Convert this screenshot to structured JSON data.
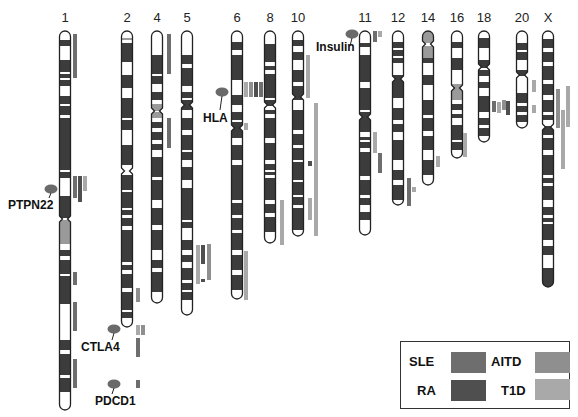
{
  "figure": {
    "type": "ideogram"
  },
  "colors": {
    "SLE": "#6e6e6e",
    "RA": "#4f4f4f",
    "AITD": "#8f8f8f",
    "T1D": "#a9a9a9",
    "band_dark": "#3c3c3c",
    "band_light": "#ffffff",
    "band_gray": "#9a9a9a",
    "gene_marker": "#6a6a6a"
  },
  "chromosomes": [
    {
      "id": "1",
      "label": "1",
      "x": 65,
      "top": 31,
      "bottom": 410,
      "centromere": 219,
      "bands": [
        [
          40,
          46,
          "d"
        ],
        [
          60,
          72,
          "d"
        ],
        [
          74,
          78,
          "d"
        ],
        [
          80,
          86,
          "d"
        ],
        [
          96,
          104,
          "d"
        ],
        [
          106,
          115,
          "d"
        ],
        [
          118,
          170,
          "d"
        ],
        [
          172,
          178,
          "d"
        ],
        [
          196,
          218,
          "d"
        ],
        [
          220,
          244,
          "g"
        ],
        [
          250,
          256,
          "d"
        ],
        [
          260,
          274,
          "d"
        ],
        [
          276,
          304,
          "d"
        ],
        [
          340,
          350,
          "d"
        ],
        [
          354,
          375,
          "d"
        ],
        [
          378,
          392,
          "d"
        ]
      ]
    },
    {
      "id": "2",
      "label": "2",
      "x": 127,
      "top": 31,
      "bottom": 327,
      "centromere": 171,
      "bands": [
        [
          38,
          40,
          "g"
        ],
        [
          43,
          62,
          "d"
        ],
        [
          75,
          88,
          "d"
        ],
        [
          98,
          118,
          "d"
        ],
        [
          120,
          130,
          "d"
        ],
        [
          145,
          165,
          "d"
        ],
        [
          175,
          190,
          "d"
        ],
        [
          192,
          208,
          "d"
        ],
        [
          210,
          215,
          "d"
        ],
        [
          218,
          226,
          "d"
        ],
        [
          230,
          262,
          "d"
        ],
        [
          265,
          270,
          "d"
        ],
        [
          274,
          288,
          "d"
        ],
        [
          292,
          310,
          "d"
        ],
        [
          312,
          318,
          "d"
        ]
      ]
    },
    {
      "id": "4",
      "label": "4",
      "x": 157,
      "top": 31,
      "bottom": 303,
      "centromere": 111,
      "bands": [
        [
          55,
          74,
          "d"
        ],
        [
          76,
          84,
          "d"
        ],
        [
          92,
          100,
          "d"
        ],
        [
          104,
          111,
          "g"
        ],
        [
          112,
          118,
          "g"
        ],
        [
          122,
          128,
          "d"
        ],
        [
          132,
          140,
          "d"
        ],
        [
          144,
          150,
          "d"
        ],
        [
          157,
          177,
          "d"
        ],
        [
          180,
          200,
          "d"
        ],
        [
          208,
          225,
          "d"
        ],
        [
          230,
          250,
          "d"
        ],
        [
          260,
          268,
          "d"
        ],
        [
          272,
          292,
          "d"
        ]
      ]
    },
    {
      "id": "5",
      "label": "5",
      "x": 187,
      "top": 31,
      "bottom": 315,
      "centromere": 105,
      "bands": [
        [
          55,
          64,
          "d"
        ],
        [
          68,
          86,
          "d"
        ],
        [
          92,
          98,
          "d"
        ],
        [
          100,
          110,
          "d"
        ],
        [
          118,
          130,
          "d"
        ],
        [
          135,
          150,
          "d"
        ],
        [
          152,
          160,
          "d"
        ],
        [
          167,
          180,
          "d"
        ],
        [
          188,
          220,
          "d"
        ],
        [
          222,
          228,
          "d"
        ],
        [
          240,
          250,
          "d"
        ],
        [
          255,
          262,
          "d"
        ],
        [
          268,
          280,
          "d"
        ],
        [
          283,
          290,
          "d"
        ],
        [
          292,
          300,
          "d"
        ]
      ]
    },
    {
      "id": "6",
      "label": "6",
      "x": 237,
      "top": 31,
      "bottom": 299,
      "centromere": 128,
      "bands": [
        [
          42,
          50,
          "d"
        ],
        [
          55,
          80,
          "d"
        ],
        [
          95,
          105,
          "d"
        ],
        [
          112,
          120,
          "d"
        ],
        [
          122,
          138,
          "d"
        ],
        [
          145,
          160,
          "d"
        ],
        [
          165,
          200,
          "d"
        ],
        [
          203,
          215,
          "d"
        ],
        [
          218,
          230,
          "d"
        ],
        [
          233,
          250,
          "d"
        ],
        [
          255,
          270,
          "d"
        ],
        [
          275,
          290,
          "d"
        ]
      ]
    },
    {
      "id": "8",
      "label": "8",
      "x": 270,
      "top": 31,
      "bottom": 243,
      "centromere": 105,
      "bands": [
        [
          44,
          62,
          "d"
        ],
        [
          66,
          70,
          "d"
        ],
        [
          74,
          98,
          "d"
        ],
        [
          100,
          106,
          "d"
        ],
        [
          110,
          114,
          "d"
        ],
        [
          118,
          138,
          "d"
        ],
        [
          143,
          160,
          "d"
        ],
        [
          164,
          170,
          "d"
        ],
        [
          172,
          175,
          "d"
        ],
        [
          178,
          200,
          "d"
        ],
        [
          204,
          213,
          "d"
        ],
        [
          217,
          232,
          "d"
        ]
      ]
    },
    {
      "id": "10",
      "label": "10",
      "x": 298,
      "top": 31,
      "bottom": 236,
      "centromere": 97,
      "bands": [
        [
          40,
          46,
          "d"
        ],
        [
          52,
          60,
          "d"
        ],
        [
          70,
          82,
          "d"
        ],
        [
          86,
          100,
          "d"
        ],
        [
          110,
          130,
          "d"
        ],
        [
          134,
          145,
          "d"
        ],
        [
          148,
          160,
          "d"
        ],
        [
          162,
          180,
          "d"
        ],
        [
          182,
          195,
          "d"
        ],
        [
          197,
          205,
          "d"
        ],
        [
          208,
          230,
          "d"
        ]
      ]
    },
    {
      "id": "11",
      "label": "11",
      "x": 365,
      "top": 31,
      "bottom": 235,
      "centromere": 117,
      "bands": [
        [
          43,
          47,
          "d"
        ],
        [
          55,
          82,
          "d"
        ],
        [
          88,
          110,
          "d"
        ],
        [
          112,
          132,
          "d"
        ],
        [
          137,
          140,
          "d"
        ],
        [
          142,
          148,
          "d"
        ],
        [
          152,
          176,
          "d"
        ],
        [
          180,
          195,
          "d"
        ],
        [
          198,
          205,
          "d"
        ],
        [
          212,
          220,
          "d"
        ]
      ]
    },
    {
      "id": "12",
      "label": "12",
      "x": 398,
      "top": 31,
      "bottom": 205,
      "centromere": 79,
      "bands": [
        [
          42,
          48,
          "d"
        ],
        [
          50,
          56,
          "d"
        ],
        [
          58,
          63,
          "d"
        ],
        [
          75,
          98,
          "d"
        ],
        [
          108,
          120,
          "d"
        ],
        [
          124,
          132,
          "d"
        ],
        [
          140,
          160,
          "d"
        ],
        [
          170,
          180,
          "d"
        ],
        [
          185,
          200,
          "d"
        ]
      ]
    },
    {
      "id": "14",
      "label": "14",
      "x": 428,
      "top": 31,
      "bottom": 185,
      "centromere": 44,
      "bands": [
        [
          31,
          43,
          "g"
        ],
        [
          46,
          58,
          "g"
        ],
        [
          58,
          63,
          "d"
        ],
        [
          75,
          85,
          "d"
        ],
        [
          100,
          115,
          "d"
        ],
        [
          118,
          131,
          "d"
        ],
        [
          136,
          150,
          "d"
        ],
        [
          160,
          175,
          "d"
        ]
      ]
    },
    {
      "id": "16",
      "label": "16",
      "x": 457,
      "top": 31,
      "bottom": 158,
      "centromere": 88,
      "bands": [
        [
          42,
          48,
          "d"
        ],
        [
          58,
          70,
          "d"
        ],
        [
          84,
          92,
          "g"
        ],
        [
          92,
          100,
          "g"
        ],
        [
          104,
          110,
          "d"
        ],
        [
          114,
          118,
          "d"
        ],
        [
          125,
          140,
          "d"
        ],
        [
          142,
          150,
          "d"
        ]
      ]
    },
    {
      "id": "18",
      "label": "18",
      "x": 484,
      "top": 31,
      "bottom": 142,
      "centromere": 67,
      "bands": [
        [
          38,
          48,
          "d"
        ],
        [
          60,
          68,
          "d"
        ],
        [
          70,
          76,
          "d"
        ],
        [
          82,
          88,
          "d"
        ],
        [
          96,
          112,
          "d"
        ],
        [
          118,
          125,
          "d"
        ],
        [
          128,
          136,
          "d"
        ]
      ]
    },
    {
      "id": "20",
      "label": "20",
      "x": 522,
      "top": 31,
      "bottom": 128,
      "centromere": 75,
      "bands": [
        [
          43,
          50,
          "d"
        ],
        [
          52,
          60,
          "d"
        ],
        [
          70,
          76,
          "d"
        ],
        [
          93,
          103,
          "d"
        ],
        [
          106,
          112,
          "d"
        ],
        [
          115,
          122,
          "d"
        ]
      ]
    },
    {
      "id": "X",
      "label": "X",
      "x": 548,
      "top": 31,
      "bottom": 287,
      "centromere": 127,
      "bands": [
        [
          39,
          48,
          "d"
        ],
        [
          52,
          62,
          "d"
        ],
        [
          66,
          80,
          "d"
        ],
        [
          84,
          95,
          "d"
        ],
        [
          100,
          112,
          "d"
        ],
        [
          115,
          120,
          "d"
        ],
        [
          126,
          135,
          "d"
        ],
        [
          138,
          150,
          "d"
        ],
        [
          155,
          175,
          "d"
        ],
        [
          178,
          183,
          "d"
        ],
        [
          186,
          200,
          "d"
        ],
        [
          207,
          215,
          "d"
        ],
        [
          218,
          222,
          "d"
        ],
        [
          224,
          240,
          "d"
        ],
        [
          246,
          255,
          "d"
        ],
        [
          268,
          287,
          "d"
        ]
      ]
    }
  ],
  "linkage_bars": [
    {
      "chr": "1",
      "x": 73,
      "y1": 34,
      "y2": 78,
      "w": 4,
      "disease": "SLE"
    },
    {
      "chr": "1",
      "x": 73,
      "y1": 176,
      "y2": 198,
      "w": 4,
      "disease": "SLE"
    },
    {
      "chr": "1",
      "x": 78,
      "y1": 176,
      "y2": 202,
      "w": 4,
      "disease": "RA"
    },
    {
      "chr": "1",
      "x": 83,
      "y1": 176,
      "y2": 191,
      "w": 4,
      "disease": "T1D"
    },
    {
      "chr": "1",
      "x": 73,
      "y1": 272,
      "y2": 285,
      "w": 4,
      "disease": "SLE"
    },
    {
      "chr": "1",
      "x": 73,
      "y1": 302,
      "y2": 331,
      "w": 4,
      "disease": "SLE"
    },
    {
      "chr": "1",
      "x": 73,
      "y1": 359,
      "y2": 388,
      "w": 4,
      "disease": "SLE"
    },
    {
      "chr": "2",
      "x": 136,
      "y1": 288,
      "y2": 302,
      "w": 4,
      "disease": "AITD"
    },
    {
      "chr": "2",
      "x": 136,
      "y1": 325,
      "y2": 335,
      "w": 4,
      "disease": "T1D"
    },
    {
      "chr": "2",
      "x": 141,
      "y1": 325,
      "y2": 335,
      "w": 4,
      "disease": "AITD"
    },
    {
      "chr": "2",
      "x": 136,
      "y1": 338,
      "y2": 357,
      "w": 4,
      "disease": "SLE"
    },
    {
      "chr": "2",
      "x": 136,
      "y1": 380,
      "y2": 388,
      "w": 4,
      "disease": "SLE"
    },
    {
      "chr": "4",
      "x": 167,
      "y1": 34,
      "y2": 74,
      "w": 4,
      "disease": "SLE"
    },
    {
      "chr": "4",
      "x": 167,
      "y1": 118,
      "y2": 148,
      "w": 4,
      "disease": "SLE"
    },
    {
      "chr": "5",
      "x": 196,
      "y1": 245,
      "y2": 284,
      "w": 4,
      "disease": "T1D"
    },
    {
      "chr": "5",
      "x": 201,
      "y1": 245,
      "y2": 264,
      "w": 4,
      "disease": "RA"
    },
    {
      "chr": "5",
      "x": 201,
      "y1": 279,
      "y2": 282,
      "w": 4,
      "disease": "RA"
    },
    {
      "chr": "5",
      "x": 207,
      "y1": 244,
      "y2": 280,
      "w": 4,
      "disease": "AITD"
    },
    {
      "chr": "6",
      "x": 244,
      "y1": 82,
      "y2": 97,
      "w": 4,
      "disease": "T1D"
    },
    {
      "chr": "6",
      "x": 249,
      "y1": 82,
      "y2": 97,
      "w": 4,
      "disease": "AITD"
    },
    {
      "chr": "6",
      "x": 254,
      "y1": 82,
      "y2": 97,
      "w": 4,
      "disease": "RA"
    },
    {
      "chr": "6",
      "x": 259,
      "y1": 82,
      "y2": 97,
      "w": 4,
      "disease": "SLE"
    },
    {
      "chr": "6",
      "x": 244,
      "y1": 123,
      "y2": 130,
      "w": 4,
      "disease": "T1D"
    },
    {
      "chr": "6",
      "x": 244,
      "y1": 251,
      "y2": 300,
      "w": 4,
      "disease": "T1D"
    },
    {
      "chr": "8",
      "x": 280,
      "y1": 200,
      "y2": 245,
      "w": 4,
      "disease": "T1D"
    },
    {
      "chr": "10",
      "x": 306,
      "y1": 55,
      "y2": 98,
      "w": 4,
      "disease": "T1D"
    },
    {
      "chr": "10",
      "x": 314,
      "y1": 103,
      "y2": 236,
      "w": 4,
      "disease": "T1D"
    },
    {
      "chr": "10",
      "x": 308,
      "y1": 161,
      "y2": 166,
      "w": 4,
      "disease": "RA"
    },
    {
      "chr": "10",
      "x": 308,
      "y1": 198,
      "y2": 220,
      "w": 4,
      "disease": "T1D"
    },
    {
      "chr": "11",
      "x": 373,
      "y1": 31,
      "y2": 42,
      "w": 4,
      "disease": "SLE"
    },
    {
      "chr": "11",
      "x": 378,
      "y1": 31,
      "y2": 37,
      "w": 4,
      "disease": "T1D"
    },
    {
      "chr": "11",
      "x": 373,
      "y1": 132,
      "y2": 153,
      "w": 4,
      "disease": "T1D"
    },
    {
      "chr": "11",
      "x": 378,
      "y1": 153,
      "y2": 173,
      "w": 4,
      "disease": "SLE"
    },
    {
      "chr": "12",
      "x": 407,
      "y1": 178,
      "y2": 206,
      "w": 4,
      "disease": "SLE"
    },
    {
      "chr": "12",
      "x": 412,
      "y1": 187,
      "y2": 192,
      "w": 4,
      "disease": "T1D"
    },
    {
      "chr": "14",
      "x": 436,
      "y1": 156,
      "y2": 167,
      "w": 4,
      "disease": "T1D"
    },
    {
      "chr": "16",
      "x": 463,
      "y1": 133,
      "y2": 157,
      "w": 4,
      "disease": "T1D"
    },
    {
      "chr": "18",
      "x": 492,
      "y1": 101,
      "y2": 112,
      "w": 4,
      "disease": "SLE"
    },
    {
      "chr": "18",
      "x": 497,
      "y1": 102,
      "y2": 113,
      "w": 4,
      "disease": "T1D"
    },
    {
      "chr": "18",
      "x": 502,
      "y1": 100,
      "y2": 110,
      "w": 4,
      "disease": "AITD"
    },
    {
      "chr": "18",
      "x": 506,
      "y1": 101,
      "y2": 115,
      "w": 4,
      "disease": "RA"
    },
    {
      "chr": "20",
      "x": 532,
      "y1": 80,
      "y2": 92,
      "w": 4,
      "disease": "T1D"
    },
    {
      "chr": "20",
      "x": 532,
      "y1": 105,
      "y2": 113,
      "w": 4,
      "disease": "T1D"
    },
    {
      "chr": "X",
      "x": 556,
      "y1": 89,
      "y2": 128,
      "w": 4,
      "disease": "AITD"
    },
    {
      "chr": "X",
      "x": 561,
      "y1": 110,
      "y2": 169,
      "w": 4,
      "disease": "T1D"
    },
    {
      "chr": "X",
      "x": 566,
      "y1": 86,
      "y2": 127,
      "w": 4,
      "disease": "T1D"
    }
  ],
  "genes": [
    {
      "name": "PTPN22",
      "label_x": 8,
      "label_y": 202,
      "marker_x": 51,
      "marker_y": 189,
      "line_to_y": 198
    },
    {
      "name": "HLA",
      "label_x": 203,
      "label_y": 115,
      "marker_x": 222,
      "marker_y": 92,
      "line_to_y": 110
    },
    {
      "name": "Insulin",
      "label_x": 316,
      "label_y": 44,
      "marker_x": 352,
      "marker_y": 34,
      "line_to_y": 46
    },
    {
      "name": "CTLA4",
      "label_x": 81,
      "label_y": 344,
      "marker_x": 114,
      "marker_y": 329,
      "line_to_y": 340
    },
    {
      "name": "PDCD1",
      "label_x": 95,
      "label_y": 398,
      "marker_x": 114,
      "marker_y": 384,
      "line_to_y": 394
    }
  ],
  "legend": {
    "items": [
      {
        "label": "SLE",
        "disease": "SLE"
      },
      {
        "label": "AITD",
        "disease": "AITD"
      },
      {
        "label": "RA",
        "disease": "RA"
      },
      {
        "label": "T1D",
        "disease": "T1D"
      }
    ]
  }
}
